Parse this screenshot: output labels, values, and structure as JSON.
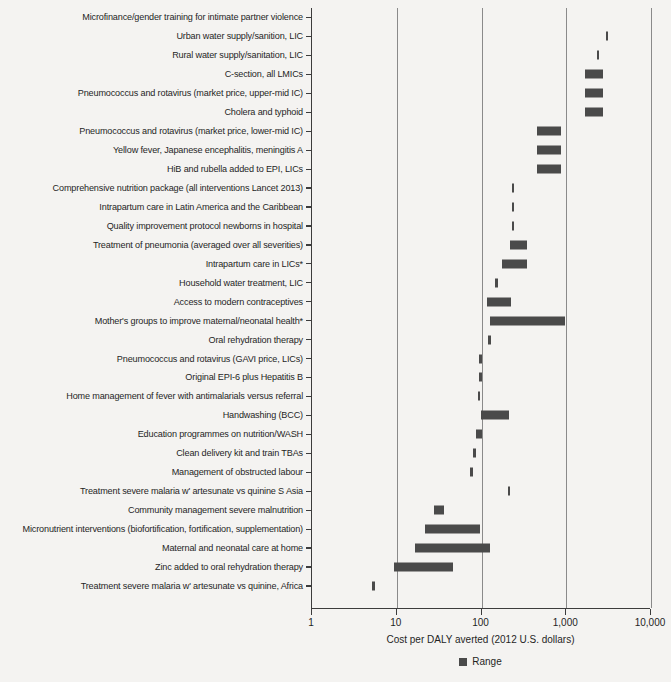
{
  "chart_data": {
    "type": "bar",
    "orientation": "horizontal",
    "scale": "log",
    "title": "",
    "xlabel": "Cost per DALY averted (2012 U.S. dollars)",
    "ylabel": "",
    "xlim": [
      1,
      10000
    ],
    "xticks": [
      1,
      10,
      100,
      1000,
      10000
    ],
    "xticklabels": [
      "1",
      "10",
      "100",
      "1,000",
      "10,000"
    ],
    "grid": "vertical",
    "legend": {
      "position": "bottom-center",
      "entries": [
        {
          "label": "Range",
          "color": "#4a4a4a"
        }
      ]
    },
    "series_name": "Range",
    "bar_color": "#4a4a4a",
    "categories": [
      "Microfinance/gender training for intimate partner violence",
      "Urban water supply/sanition, LIC",
      "Rural water supply/sanitation, LIC",
      "C-section, all LMICs",
      "Pneumococcus and rotavirus (market price, upper-mid IC)",
      "Cholera and typhoid",
      "Pneumococcus and rotavirus (market price, lower-mid IC)",
      "Yellow fever, Japanese encephalitis, meningitis A",
      "HiB and rubella added to EPI, LICs",
      "Comprehensive nutrition package (all interventions Lancet 2013)",
      "Intrapartum care in Latin America and the Caribbean",
      "Quality improvement protocol newborns in hospital",
      "Treatment of pneumonia (averaged over all severities)",
      "Intrapartum care in LICs*",
      "Household water treatment, LIC",
      "Access to modern contraceptives",
      "Mother's groups to improve maternal/neonatal health*",
      "Oral rehydration therapy",
      "Pneumococcus and rotavirus (GAVI price, LICs)",
      "Original EPI-6 plus Hepatitis B",
      "Home management of fever with  antimalarials versus referral",
      "Handwashing (BCC)",
      "Education programmes on nutrition/WASH",
      "Clean delivery kit and train TBAs",
      "Management of obstructed labour",
      "Treatment severe malaria w' artesunate vs quinine S Asia",
      "Community management severe malnutrition",
      "Micronutrient interventions (biofortification, fortification, supplementation)",
      "Maternal and neonatal care at home",
      "Zinc added to oral rehydration therapy",
      "Treatment  severe malaria w' artesunate vs quinine, Africa"
    ],
    "ranges": [
      {
        "category": "Microfinance/gender training for intimate partner violence",
        "low": null,
        "high": null
      },
      {
        "category": "Urban water supply/sanition, LIC",
        "low": 3000,
        "high": 3200
      },
      {
        "category": "Rural water supply/sanitation, LIC",
        "low": 2350,
        "high": 2500
      },
      {
        "category": "C-section, all LMICs",
        "low": 1700,
        "high": 2800
      },
      {
        "category": "Pneumococcus and rotavirus (market price, upper-mid IC)",
        "low": 1700,
        "high": 2800
      },
      {
        "category": "Cholera and typhoid",
        "low": 1700,
        "high": 2800
      },
      {
        "category": "Pneumococcus and rotavirus (market price, lower-mid IC)",
        "low": 460,
        "high": 900
      },
      {
        "category": "Yellow fever, Japanese encephalitis, meningitis A",
        "low": 460,
        "high": 900
      },
      {
        "category": "HiB and rubella added to EPI, LICs",
        "low": 460,
        "high": 900
      },
      {
        "category": "Comprehensive nutrition package (all interventions Lancet 2013)",
        "low": 235,
        "high": 245
      },
      {
        "category": "Intrapartum care in Latin America and the Caribbean",
        "low": 235,
        "high": 245
      },
      {
        "category": "Quality improvement protocol newborns in hospital",
        "low": 235,
        "high": 245
      },
      {
        "category": "Treatment of pneumonia (averaged over all severities)",
        "low": 220,
        "high": 350
      },
      {
        "category": "Intrapartum care in LICs*",
        "low": 180,
        "high": 350
      },
      {
        "category": "Household water treatment, LIC",
        "low": 150,
        "high": 160
      },
      {
        "category": "Access to modern contraceptives",
        "low": 120,
        "high": 230
      },
      {
        "category": "Mother's groups to improve maternal/neonatal health*",
        "low": 130,
        "high": 1000
      },
      {
        "category": "Oral rehydration therapy",
        "low": 123,
        "high": 128
      },
      {
        "category": "Pneumococcus and rotavirus (GAVI price, LICs)",
        "low": 97,
        "high": 100
      },
      {
        "category": "Original EPI-6 plus Hepatitis B",
        "low": 97,
        "high": 102
      },
      {
        "category": "Home management of fever with  antimalarials versus referral",
        "low": 93,
        "high": 97
      },
      {
        "category": "Handwashing (BCC)",
        "low": 100,
        "high": 215
      },
      {
        "category": "Education programmes on nutrition/WASH",
        "low": 88,
        "high": 103
      },
      {
        "category": "Clean delivery kit and train TBAs",
        "low": 82,
        "high": 86
      },
      {
        "category": "Management of obstructed labour",
        "low": 76,
        "high": 82
      },
      {
        "category": "Treatment severe malaria w' artesunate vs quinine S Asia",
        "low": 210,
        "high": 215
      },
      {
        "category": "Community management severe malnutrition",
        "low": 28,
        "high": 37
      },
      {
        "category": "Micronutrient interventions (biofortification, fortification, supplementation)",
        "low": 22,
        "high": 100
      },
      {
        "category": "Maternal and neonatal care at home",
        "low": 17,
        "high": 130
      },
      {
        "category": "Zinc added to oral rehydration therapy",
        "low": 9.5,
        "high": 47
      },
      {
        "category": "Treatment  severe malaria w' artesunate vs quinine, Africa",
        "low": 5.3,
        "high": 5.7
      }
    ]
  }
}
